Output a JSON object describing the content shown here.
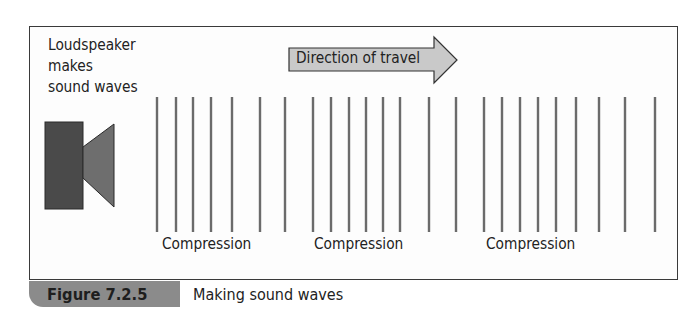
{
  "figure": {
    "number": "Figure 7.2.5",
    "caption": "Making sound waves"
  },
  "labels": {
    "speaker": [
      "Loudspeaker",
      "makes",
      "sound waves"
    ],
    "direction": "Direction of travel",
    "compressions": [
      "Compression",
      "Compression",
      "Compression"
    ]
  },
  "colors": {
    "frame_border": "#3a3a3a",
    "wave_line": "#6b6b6b",
    "speaker_box": "#4a4a4a",
    "speaker_cone": "#6e6e6e",
    "arrow_fill": "#c9c9c9",
    "caption_tab": "#8b8b8b"
  },
  "wave_lines_x": [
    157,
    176,
    193,
    211,
    232,
    260,
    285,
    313,
    331,
    349,
    366,
    383,
    400,
    429,
    456,
    484,
    502,
    520,
    538,
    556,
    576,
    599,
    625,
    655
  ],
  "compression_label_x": [
    162,
    314,
    486
  ]
}
